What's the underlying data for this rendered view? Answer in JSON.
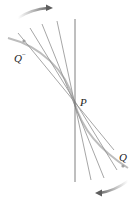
{
  "diagram": {
    "labels": {
      "q_minus": "Q",
      "q_minus_sup": "−",
      "p": "P",
      "q": "Q"
    },
    "colors": {
      "curve": "#b5b5b5",
      "lines": "#8a8a8a",
      "tangent": "#6e6e6e",
      "arrow": "#7a7a7a",
      "background": "#ffffff"
    },
    "point_p": [
      74,
      101
    ],
    "secant_angles_from_vertical_deg": [
      0,
      12,
      22,
      30,
      38
    ],
    "arrows": [
      {
        "name": "top-rotation-arrow",
        "direction": "clockwise-right"
      },
      {
        "name": "bottom-rotation-arrow",
        "direction": "clockwise-left"
      }
    ]
  }
}
